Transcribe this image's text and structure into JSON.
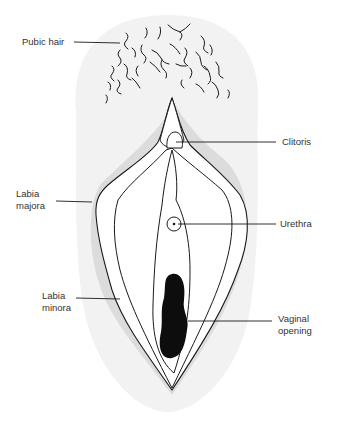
{
  "diagram": {
    "type": "anatomical-illustration",
    "colors": {
      "background": "#ffffff",
      "skin_light": "#f2f2f2",
      "skin_shadow": "#dcdcdc",
      "outline": "#1a1a1a",
      "opening": "#0d0d0d",
      "label_text": "#333333"
    },
    "labels": [
      {
        "id": "pubic-hair",
        "text": "Pubic hair",
        "x": 22,
        "y": 36
      },
      {
        "id": "clitoris",
        "text": "Clitoris",
        "x": 282,
        "y": 138
      },
      {
        "id": "labia-majora",
        "text": "Labia\nmajora",
        "x": 16,
        "y": 188
      },
      {
        "id": "urethra",
        "text": "Urethra",
        "x": 280,
        "y": 220
      },
      {
        "id": "labia-minora",
        "text": "Labia\nminora",
        "x": 42,
        "y": 290
      },
      {
        "id": "vaginal-opening",
        "text": "Vaginal\nopening",
        "x": 278,
        "y": 313
      }
    ]
  }
}
